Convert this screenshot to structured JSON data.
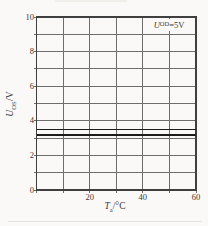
{
  "figure": {
    "background": "#faf9f7",
    "y_axis_label": {
      "symbol": "U",
      "sub": "OS",
      "unit": "/V"
    },
    "x_axis_label": {
      "symbol": "T",
      "sub": "a",
      "unit": "/°C"
    },
    "annotation": {
      "symbol": "U",
      "sub": "OD",
      "rest": "=5V"
    }
  },
  "chart_data": {
    "type": "line",
    "title": "",
    "xlabel": "Ta/°C",
    "ylabel": "UOS/V",
    "annotation": "UOD=5V",
    "xlim": [
      0,
      60
    ],
    "ylim": [
      0,
      10
    ],
    "x_ticks": [
      0,
      10,
      20,
      30,
      40,
      50,
      60
    ],
    "x_tick_labels": [
      "",
      "",
      "20",
      "",
      "40",
      "",
      "60"
    ],
    "y_ticks": [
      0,
      1,
      2,
      3,
      4,
      5,
      6,
      7,
      8,
      9,
      10
    ],
    "y_tick_labels": [
      "0",
      "",
      "2",
      "",
      "4",
      "",
      "6",
      "",
      "8",
      "",
      "10"
    ],
    "grid": true,
    "legend": "none",
    "colors": {
      "grid": "#6e6e6e",
      "border": "#3f3f3f",
      "series": "#1c1c1c",
      "text": "#3a3a3a"
    },
    "series": [
      {
        "name": "UOS-upper-line",
        "x": [
          0,
          60
        ],
        "values": [
          3.5,
          3.5
        ]
      },
      {
        "name": "UOS-lower-line",
        "x": [
          0,
          60
        ],
        "values": [
          3.2,
          3.2
        ]
      }
    ]
  }
}
